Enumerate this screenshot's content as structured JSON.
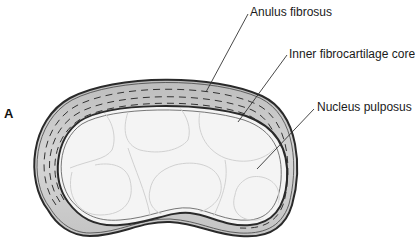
{
  "figure": {
    "panel_letter": "A",
    "labels": {
      "anulus": "Anulus fibrosus",
      "inner_core": "Inner fibrocartilage core",
      "nucleus": "Nucleus pulposus"
    },
    "colors": {
      "anulus_fill": "#c8c8c8",
      "outline": "#2a2a2a",
      "nucleus_fill": "#f4f4f4",
      "cell_lines": "#cfcfcf",
      "leader": "#333333"
    }
  }
}
